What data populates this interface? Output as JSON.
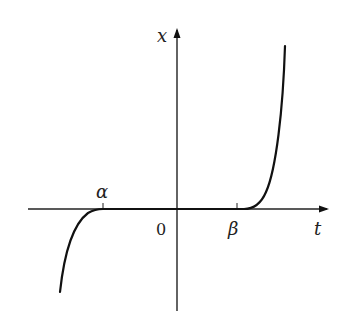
{
  "diagram": {
    "type": "function-graph",
    "axes": {
      "horizontal_label": "t",
      "vertical_label": "x",
      "origin_label": "0"
    },
    "ticks": [
      {
        "label": "α",
        "position": "left of origin on t-axis"
      },
      {
        "label": "β",
        "position": "right of origin on t-axis"
      }
    ],
    "curve": {
      "description": "x(t) is zero on [α, β]; decreases steeply below zero for t < α; increases steeply above zero for t > β",
      "color": "#111111"
    }
  }
}
